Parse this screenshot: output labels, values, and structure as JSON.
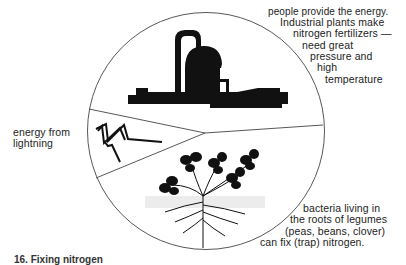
{
  "diagram": {
    "sections": [
      {
        "id": "industrial",
        "icon": "factory-icon",
        "lines": [
          "people provide the energy.",
          "Industrial plants make",
          "nitrogen fertilizers —",
          "need great",
          "pressure and",
          "high",
          "temperature"
        ]
      },
      {
        "id": "lightning",
        "icon": "lightning-icon",
        "lines": [
          "energy from",
          "lightning"
        ]
      },
      {
        "id": "legumes",
        "icon": "legume-plant-icon",
        "lines": [
          "bacteria living in",
          "the roots of legumes",
          "(peas, beans, clover)",
          "can fix (trap) nitrogen."
        ]
      }
    ],
    "caption": "16. Fixing nitrogen"
  },
  "colors": {
    "ink": "#111111",
    "line": "#444444",
    "background": "#ffffff"
  }
}
